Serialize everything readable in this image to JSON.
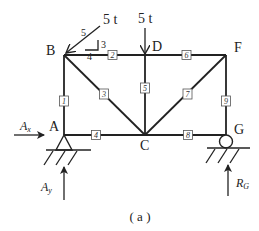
{
  "figure": {
    "caption": "( a )",
    "nodes": {
      "A": {
        "label": "A",
        "x": 64,
        "y": 135
      },
      "B": {
        "label": "B",
        "x": 64,
        "y": 55
      },
      "C": {
        "label": "C",
        "x": 145,
        "y": 135
      },
      "D": {
        "label": "D",
        "x": 145,
        "y": 55
      },
      "F": {
        "label": "F",
        "x": 226,
        "y": 55
      },
      "G": {
        "label": "G",
        "x": 226,
        "y": 135
      }
    },
    "members": [
      {
        "id": "1",
        "from": "A",
        "to": "B"
      },
      {
        "id": "2",
        "from": "B",
        "to": "D"
      },
      {
        "id": "3",
        "from": "B",
        "to": "C"
      },
      {
        "id": "4",
        "from": "A",
        "to": "C"
      },
      {
        "id": "5",
        "from": "D",
        "to": "C"
      },
      {
        "id": "6",
        "from": "D",
        "to": "F"
      },
      {
        "id": "7",
        "from": "C",
        "to": "F"
      },
      {
        "id": "8",
        "from": "C",
        "to": "G"
      },
      {
        "id": "9",
        "from": "F",
        "to": "G"
      }
    ],
    "loads": {
      "inclined": {
        "magnitude": "5 t",
        "at": "B",
        "slope_hyp": "5",
        "slope_rise": "3",
        "slope_run": "4"
      },
      "vertical": {
        "magnitude": "5 t",
        "at": "D"
      }
    },
    "supports": {
      "pin": {
        "at": "A"
      },
      "roller": {
        "at": "G"
      }
    },
    "reactions": {
      "ax": {
        "symbol": "A",
        "sub": "x"
      },
      "ay": {
        "symbol": "A",
        "sub": "y"
      },
      "rg": {
        "symbol": "R",
        "sub": "G"
      }
    }
  }
}
